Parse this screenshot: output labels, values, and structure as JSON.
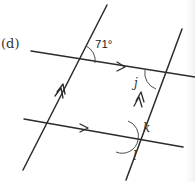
{
  "diagram": {
    "part_label": "(d)",
    "given_angle": "71°",
    "unknowns": {
      "j": "j",
      "k": "k",
      "l": "l"
    },
    "colors": {
      "line": "#2b2b2b",
      "text": "#333333",
      "background": "#ffffff"
    }
  }
}
